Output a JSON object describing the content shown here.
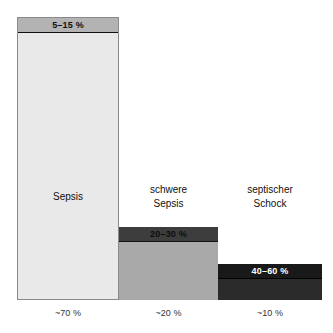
{
  "chart_data": {
    "type": "bar",
    "title": "",
    "xlabel": "",
    "ylabel": "",
    "grid": false,
    "legend": "none",
    "categories": [
      "Sepsis",
      "schwere Sepsis",
      "septischer Schock"
    ],
    "series": [
      {
        "name": "Anteil",
        "values": [
          70,
          20,
          10
        ],
        "value_labels": [
          "~70 %",
          "~20 %",
          "~10 %"
        ]
      },
      {
        "name": "Letalitaet",
        "values": [
          10,
          25,
          50
        ],
        "value_labels": [
          "5–15 %",
          "20–30 %",
          "40–60 %"
        ]
      }
    ]
  },
  "bars": [
    {
      "id": "sepsis",
      "header_label": "5–15 %",
      "category_lines": [
        "Sepsis"
      ],
      "axis_label": "~70 %",
      "body_color": "#e9e9e9",
      "header_color": "#b3b3b3"
    },
    {
      "id": "schwere-sepsis",
      "header_label": "20–30 %",
      "category_lines": [
        "schwere",
        "Sepsis"
      ],
      "axis_label": "~20 %",
      "body_color": "#a9a9a9",
      "header_color": "#3d3d3d"
    },
    {
      "id": "septischer-schock",
      "header_label": "40–60 %",
      "category_lines": [
        "septischer",
        "Schock"
      ],
      "axis_label": "~10 %",
      "body_color": "#2b2b2b",
      "header_color": "#191919"
    }
  ]
}
